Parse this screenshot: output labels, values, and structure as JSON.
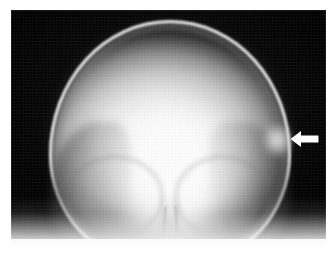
{
  "figure": {
    "modality": "X-ray radiograph",
    "view": "anteroposterior skull",
    "caption": "",
    "alt_text": "Anteroposterior skull radiograph showing the cranial vault with a white arrow indicating a focal bulging lesion of the right outer table"
  },
  "plate": {
    "background_color": "#070707",
    "border_color": "#ffffff",
    "left": 11,
    "top": 10,
    "width": 315,
    "height": 236
  },
  "anatomy": [
    {
      "name": "cranial-vault",
      "label": "Cranial vault"
    },
    {
      "name": "outer-table",
      "label": "Outer table of calvarium"
    },
    {
      "name": "diploic-space",
      "label": "Diploic space"
    },
    {
      "name": "scalp-soft-tissue",
      "label": "Scalp soft tissue"
    },
    {
      "name": "orbital-roof-left",
      "label": "Left orbital roof"
    },
    {
      "name": "orbital-roof-right",
      "label": "Right orbital roof"
    },
    {
      "name": "temporal-bone-left",
      "label": "Left temporal region"
    },
    {
      "name": "temporal-bone-right",
      "label": "Right temporal region"
    },
    {
      "name": "nasal-septum",
      "label": "Nasal septum / midline"
    },
    {
      "name": "skull-base",
      "label": "Skull base"
    },
    {
      "name": "lesion",
      "label": "Focal outer table lesion"
    }
  ],
  "annotation": {
    "type": "arrow",
    "direction": "left",
    "color": "#ffffff",
    "x": 279,
    "y": 120,
    "width": 29,
    "height": 18,
    "points_to": "lesion"
  }
}
